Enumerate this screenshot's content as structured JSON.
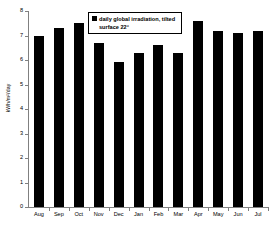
{
  "chart_data": {
    "type": "bar",
    "title": "",
    "subtitle": "",
    "xlabel": "",
    "ylabel": "kWh/m²/day",
    "categories": [
      "Aug",
      "Sep",
      "Oct",
      "Nov",
      "Dec",
      "Jan",
      "Feb",
      "Mar",
      "Apr",
      "May",
      "Jun",
      "Jul"
    ],
    "values": [
      7.0,
      7.3,
      7.5,
      6.7,
      5.9,
      6.3,
      6.6,
      6.3,
      7.6,
      7.2,
      7.1,
      7.2
    ],
    "series": [
      {
        "name": "daily global irradiation, tilted surface 22°",
        "values": [
          7.0,
          7.3,
          7.5,
          6.7,
          5.9,
          6.3,
          6.6,
          6.3,
          7.6,
          7.2,
          7.1,
          7.2
        ],
        "color": "#000000"
      }
    ],
    "ylim": [
      0,
      8
    ],
    "yticks": [
      0,
      1,
      2,
      3,
      4,
      5,
      6,
      7,
      8
    ],
    "ytick_labels": [
      "0",
      "1",
      "2",
      "3",
      "4",
      "5",
      "6",
      "7",
      "8"
    ],
    "grid": false,
    "legend_position": "top-center",
    "bar_color": "#000000",
    "axis_color": "#808080"
  },
  "legend": {
    "line1": "daily global irradiation, tilted",
    "line2": "surface 22°",
    "swatch_icon": "filled-square-icon",
    "swatch_color": "#000000"
  },
  "axes": {
    "y_title": "kWh/m²/day"
  }
}
